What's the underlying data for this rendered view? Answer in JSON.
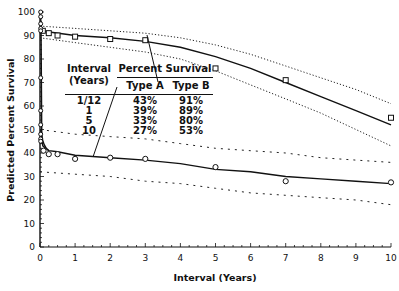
{
  "chart_data": {
    "type": "line",
    "title": "",
    "xlabel": "Interval (Years)",
    "ylabel": "Predicted Percent Survival",
    "xlim": [
      0,
      10
    ],
    "ylim": [
      0,
      100
    ],
    "x_ticks": [
      "0",
      "1",
      "2",
      "3",
      "4",
      "5",
      "6",
      "7",
      "8",
      "9",
      "10"
    ],
    "y_ticks": [
      "0",
      "10",
      "20",
      "30",
      "40",
      "50",
      "60",
      "70",
      "80",
      "90",
      "100"
    ],
    "grid": false,
    "series": [
      {
        "name": "Type B",
        "marker": "square",
        "fit_curve": [
          [
            0,
            92
          ],
          [
            1,
            90
          ],
          [
            2,
            89
          ],
          [
            3,
            87.5
          ],
          [
            4,
            85
          ],
          [
            5,
            81
          ],
          [
            6,
            76
          ],
          [
            7,
            70
          ],
          [
            8,
            64
          ],
          [
            9,
            58
          ],
          [
            10,
            52
          ]
        ],
        "upper_ci": [
          [
            0,
            94
          ],
          [
            1,
            93
          ],
          [
            2,
            92
          ],
          [
            3,
            91
          ],
          [
            4,
            89
          ],
          [
            5,
            86
          ],
          [
            6,
            82
          ],
          [
            7,
            77
          ],
          [
            8,
            72
          ],
          [
            9,
            67
          ],
          [
            10,
            61
          ]
        ],
        "lower_ci": [
          [
            0,
            89
          ],
          [
            1,
            87
          ],
          [
            2,
            85
          ],
          [
            3,
            83
          ],
          [
            4,
            80
          ],
          [
            5,
            75
          ],
          [
            6,
            69
          ],
          [
            7,
            63
          ],
          [
            8,
            57
          ],
          [
            9,
            50
          ],
          [
            10,
            43
          ]
        ],
        "points": [
          [
            0.08,
            92
          ],
          [
            0.25,
            91
          ],
          [
            0.5,
            90
          ],
          [
            1,
            89.5
          ],
          [
            2,
            88.5
          ],
          [
            3,
            88
          ],
          [
            5,
            76
          ],
          [
            7,
            71
          ],
          [
            10,
            55
          ]
        ]
      },
      {
        "name": "Type A",
        "marker": "circle",
        "fit_curve": [
          [
            0.02,
            50
          ],
          [
            0.08,
            43
          ],
          [
            0.25,
            41
          ],
          [
            0.5,
            40.5
          ],
          [
            1,
            39
          ],
          [
            2,
            38
          ],
          [
            3,
            37
          ],
          [
            4,
            35.5
          ],
          [
            5,
            33
          ],
          [
            6,
            32
          ],
          [
            7,
            30
          ],
          [
            8,
            29
          ],
          [
            9,
            28
          ],
          [
            10,
            27
          ]
        ],
        "upper_ci": [
          [
            0,
            50
          ],
          [
            1,
            48
          ],
          [
            2,
            47
          ],
          [
            3,
            46
          ],
          [
            4,
            44
          ],
          [
            5,
            42
          ],
          [
            6,
            41
          ],
          [
            7,
            40
          ],
          [
            8,
            38
          ],
          [
            9,
            37
          ],
          [
            10,
            36
          ]
        ],
        "lower_ci": [
          [
            0,
            32
          ],
          [
            1,
            31
          ],
          [
            2,
            30
          ],
          [
            3,
            28
          ],
          [
            4,
            27
          ],
          [
            5,
            25
          ],
          [
            6,
            23
          ],
          [
            7,
            22
          ],
          [
            8,
            21
          ],
          [
            9,
            20
          ],
          [
            10,
            18
          ]
        ],
        "points": [
          [
            0.1,
            41
          ],
          [
            0.25,
            39.5
          ],
          [
            0.5,
            39.5
          ],
          [
            1,
            37.5
          ],
          [
            2,
            38
          ],
          [
            3,
            37.5
          ],
          [
            5,
            34
          ],
          [
            7,
            28
          ],
          [
            10,
            27.5
          ]
        ]
      }
    ],
    "y_axis_points": [
      100,
      98,
      95,
      93,
      92,
      72,
      58,
      52,
      48,
      46,
      45
    ],
    "inset_table": {
      "headers": [
        "Interval (Years)",
        "Type A",
        "Type B"
      ],
      "group_header": "Percent Survival",
      "rows": [
        [
          "1/12",
          "43%",
          "91%"
        ],
        [
          "1",
          "39%",
          "89%"
        ],
        [
          "5",
          "33%",
          "80%"
        ],
        [
          "10",
          "27%",
          "53%"
        ]
      ]
    },
    "annotations": [
      {
        "text": "leader line from Type B column to Type B curve at ~3 years"
      },
      {
        "text": "leader line from Type A column to Type A curve at ~1.3 years"
      }
    ]
  },
  "labels": {
    "xlabel": "Interval (Years)",
    "ylabel": "Predicted Percent Survival",
    "x_ticks": [
      "0",
      "1",
      "2",
      "3",
      "4",
      "5",
      "6",
      "7",
      "8",
      "9",
      "10"
    ],
    "y_ticks": [
      "0",
      "10",
      "20",
      "30",
      "40",
      "50",
      "60",
      "70",
      "80",
      "90",
      "100"
    ]
  },
  "inset": {
    "interval_header": "Interval (Years)",
    "group_header": "Percent Survival",
    "type_a": "Type A",
    "type_b": "Type B",
    "rows": [
      {
        "interval": "1/12",
        "a": "43%",
        "b": "91%"
      },
      {
        "interval": "1",
        "a": "39%",
        "b": "89%"
      },
      {
        "interval": "5",
        "a": "33%",
        "b": "80%"
      },
      {
        "interval": "10",
        "a": "27%",
        "b": "53%"
      }
    ]
  },
  "colors": {
    "ink": "#111111",
    "background": "#ffffff"
  }
}
